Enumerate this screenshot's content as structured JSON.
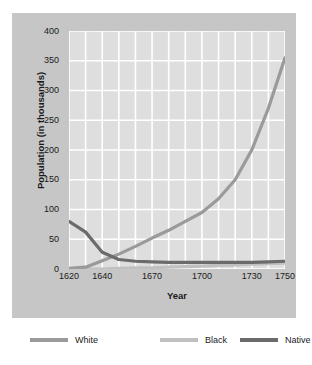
{
  "chart_data": {
    "type": "line",
    "title": "",
    "xlabel": "Year",
    "ylabel": "Population (in thousands)",
    "xlim": [
      1620,
      1750
    ],
    "ylim": [
      0,
      400
    ],
    "grid": true,
    "legend_position": "bottom",
    "xticks": [
      "1620",
      "1640",
      "1670",
      "1700",
      "1730",
      "1750"
    ],
    "xtick_values": [
      1620,
      1640,
      1670,
      1700,
      1730,
      1750
    ],
    "yticks": [
      "0",
      "50",
      "100",
      "150",
      "200",
      "250",
      "300",
      "350",
      "400"
    ],
    "ytick_values": [
      0,
      50,
      100,
      150,
      200,
      250,
      300,
      350,
      400
    ],
    "series": [
      {
        "name": "White",
        "color": "#9a9a9a",
        "x": [
          1620,
          1630,
          1640,
          1650,
          1660,
          1670,
          1680,
          1690,
          1700,
          1710,
          1720,
          1730,
          1740,
          1750
        ],
        "values": [
          1,
          3,
          14,
          25,
          38,
          52,
          65,
          80,
          95,
          118,
          150,
          200,
          270,
          355
        ]
      },
      {
        "name": "Black",
        "color": "#c0c0c0",
        "x": [
          1620,
          1630,
          1640,
          1650,
          1660,
          1670,
          1680,
          1690,
          1700,
          1710,
          1720,
          1730,
          1740,
          1750
        ],
        "values": [
          0,
          0,
          0,
          1,
          2,
          2,
          3,
          4,
          5,
          6,
          7,
          8,
          9,
          10
        ]
      },
      {
        "name": "Native American",
        "color": "#6b6b6b",
        "x": [
          1620,
          1630,
          1640,
          1650,
          1660,
          1670,
          1680,
          1690,
          1700,
          1710,
          1720,
          1730,
          1740,
          1750
        ],
        "values": [
          80,
          62,
          28,
          16,
          13,
          12,
          11,
          11,
          11,
          11,
          11,
          11,
          12,
          13
        ]
      }
    ]
  },
  "legend": {
    "items": [
      {
        "label": "White",
        "color": "#9a9a9a"
      },
      {
        "label": "Black",
        "color": "#c0c0c0"
      },
      {
        "label": "Native American",
        "color": "#6b6b6b"
      }
    ]
  },
  "colors": {
    "page_background": "#ffffff",
    "panel_background": "#c6c6c6",
    "plot_background": "#dedede",
    "gridline": "#ffffff",
    "text": "#1a1a1a"
  }
}
